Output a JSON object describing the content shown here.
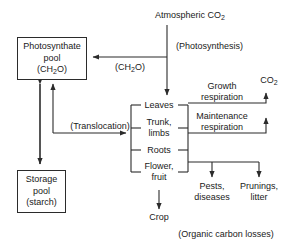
{
  "diagram": {
    "type": "flow-diagram",
    "background": "#ffffff",
    "line_color": "#2b2b2b",
    "text_color": "#1a1a1a"
  },
  "nodes": {
    "atmospheric_co2": "Atmospheric CO",
    "atmospheric_co2_sub": "2",
    "photosynthate_line1": "Photosynthate",
    "photosynthate_line2": "pool",
    "photosynthate_line3a": "(CH",
    "photosynthate_line3b": "2",
    "photosynthate_line3c": "O)",
    "storage_line1": "Storage",
    "storage_line2": "pool",
    "storage_line3": "(starch)",
    "leaves": "Leaves",
    "trunk_line1": "Trunk,",
    "trunk_line2": "limbs",
    "roots": "Roots",
    "flower_line1": "Flower,",
    "flower_line2": "fruit",
    "growth_line1": "Growth",
    "growth_line2": "respiration",
    "maintenance_line1": "Maintenance",
    "maintenance_line2": "respiration",
    "co2_out": "CO",
    "co2_out_sub": "2",
    "pests_line1": "Pests,",
    "pests_line2": "diseases",
    "prunings_line1": "Prunings,",
    "prunings_line2": "litter",
    "crop": "Crop"
  },
  "annotations": {
    "photosynthesis": "(Photosynthesis)",
    "ch2o_a": "(CH",
    "ch2o_sub": "2",
    "ch2o_b": "O)",
    "translocation": "(Translocation)",
    "organic_carbon_losses": "(Organic carbon losses)"
  }
}
